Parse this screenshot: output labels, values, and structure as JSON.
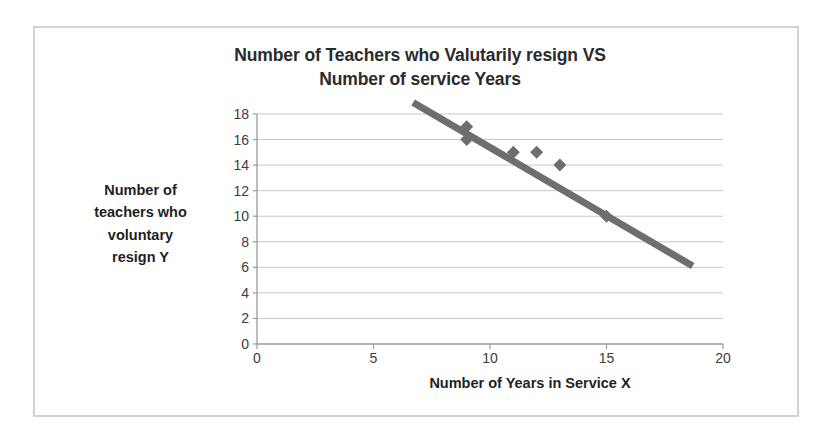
{
  "chart_data": {
    "type": "scatter",
    "title": "Number of Teachers who Valutarily resign VS Number of service Years",
    "title_line1": "Number of Teachers who Valutarily resign VS",
    "title_line2": "Number of service Years",
    "xlabel": "Number of Years in Service X",
    "ylabel": "Number of teachers who voluntary resign Y",
    "ylabel_line1": "Number of",
    "ylabel_line2": "teachers who",
    "ylabel_line3": "voluntary",
    "ylabel_line4": "resign Y",
    "xlim": [
      0,
      20
    ],
    "ylim": [
      0,
      18
    ],
    "xticks": [
      0,
      5,
      10,
      15,
      20
    ],
    "yticks": [
      0,
      2,
      4,
      6,
      8,
      10,
      12,
      14,
      16,
      18
    ],
    "grid": "horizontal",
    "legend": "none",
    "marker": "diamond",
    "marker_color": "#6e6e6e",
    "trendline_color": "#6e6e6e",
    "gridline_color": "#c8c8c8",
    "axis_color": "#9a9a9a",
    "border_color": "#d2d2d2",
    "points": [
      {
        "x": 9,
        "y": 17
      },
      {
        "x": 9,
        "y": 16
      },
      {
        "x": 11,
        "y": 15
      },
      {
        "x": 12,
        "y": 15
      },
      {
        "x": 13,
        "y": 14
      },
      {
        "x": 15,
        "y": 10
      }
    ],
    "trendline": {
      "x0": 6.7,
      "y0": 18.9,
      "x1": 18.7,
      "y1": 6.1
    }
  }
}
